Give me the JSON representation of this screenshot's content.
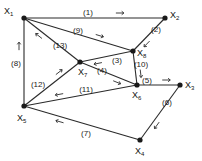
{
  "diagram": {
    "type": "directed-graph",
    "colors": {
      "line": "#2a2a2a",
      "node": "#1a1a1a",
      "background": "#ffffff"
    },
    "nodes": [
      {
        "id": "X1",
        "name": "X",
        "sub": "1",
        "x": 24,
        "y": 18,
        "lx": 4,
        "ly": 14
      },
      {
        "id": "X2",
        "name": "X",
        "sub": "2",
        "x": 165,
        "y": 18,
        "lx": 170,
        "ly": 18
      },
      {
        "id": "X8",
        "name": "X",
        "sub": "8",
        "x": 133,
        "y": 51,
        "lx": 137,
        "ly": 56
      },
      {
        "id": "X7",
        "name": "X",
        "sub": "7",
        "x": 80,
        "y": 62,
        "lx": 78,
        "ly": 75
      },
      {
        "id": "X6",
        "name": "X",
        "sub": "6",
        "x": 137,
        "y": 85,
        "lx": 132,
        "ly": 98
      },
      {
        "id": "X3",
        "name": "X",
        "sub": "3",
        "x": 180,
        "y": 85,
        "lx": 185,
        "ly": 88
      },
      {
        "id": "X5",
        "name": "X",
        "sub": "5",
        "x": 24,
        "y": 106,
        "lx": 17,
        "ly": 121
      },
      {
        "id": "X4",
        "name": "X",
        "sub": "4",
        "x": 140,
        "y": 140,
        "lx": 135,
        "ly": 154
      }
    ],
    "edges": [
      {
        "label": "(1)",
        "from": "X1",
        "to": "X2",
        "lx": 88,
        "ly": 15
      },
      {
        "label": "(2)",
        "from": "X2",
        "to": "X8",
        "lx": 156,
        "ly": 32
      },
      {
        "label": "(9)",
        "from": "X1",
        "to": "X8",
        "lx": 78,
        "ly": 33
      },
      {
        "label": "(13)",
        "from": "X7",
        "to": "X1",
        "lx": 60,
        "ly": 48
      },
      {
        "label": "(3)",
        "from": "X8",
        "to": "X7",
        "lx": 117,
        "ly": 63
      },
      {
        "label": "(4)",
        "from": "X7",
        "to": "X6",
        "lx": 102,
        "ly": 73
      },
      {
        "label": "(10)",
        "from": "X8",
        "to": "X6",
        "lx": 141,
        "ly": 67
      },
      {
        "label": "(5)",
        "from": "X6",
        "to": "X3",
        "lx": 147,
        "ly": 83
      },
      {
        "label": "(6)",
        "from": "X3",
        "to": "X4",
        "lx": 167,
        "ly": 105
      },
      {
        "label": "(7)",
        "from": "X4",
        "to": "X5",
        "lx": 86,
        "ly": 136
      },
      {
        "label": "(11)",
        "from": "X6",
        "to": "X5",
        "lx": 86,
        "ly": 92
      },
      {
        "label": "(12)",
        "from": "X5",
        "to": "X7",
        "lx": 38,
        "ly": 87
      },
      {
        "label": "(8)",
        "from": "X5",
        "to": "X1",
        "lx": 16,
        "ly": 66
      }
    ]
  }
}
